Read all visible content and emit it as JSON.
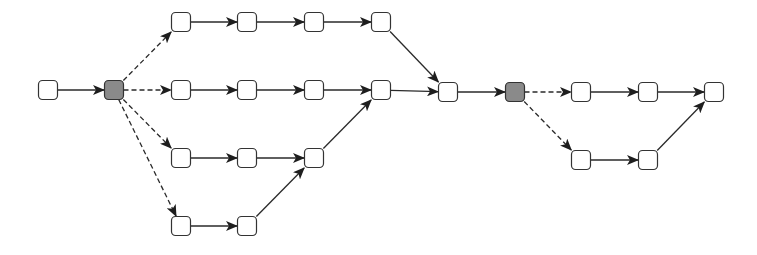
{
  "diagram": {
    "type": "process-flow-graph",
    "node_size": 19,
    "colors": {
      "node_fill": "#ffffff",
      "fork_fill": "#8a8a8a",
      "stroke": "#333333",
      "edge": "#2a2a2a"
    },
    "nodes": [
      {
        "id": "start",
        "x": 48,
        "y": 90,
        "kind": "normal"
      },
      {
        "id": "fork1",
        "x": 114,
        "y": 90,
        "kind": "fork"
      },
      {
        "id": "r1a",
        "x": 181,
        "y": 22,
        "kind": "normal"
      },
      {
        "id": "r1b",
        "x": 247,
        "y": 22,
        "kind": "normal"
      },
      {
        "id": "r1c",
        "x": 314,
        "y": 22,
        "kind": "normal"
      },
      {
        "id": "r1d",
        "x": 381,
        "y": 22,
        "kind": "normal"
      },
      {
        "id": "r2a",
        "x": 181,
        "y": 90,
        "kind": "normal"
      },
      {
        "id": "r2b",
        "x": 247,
        "y": 90,
        "kind": "normal"
      },
      {
        "id": "r2c",
        "x": 314,
        "y": 90,
        "kind": "normal"
      },
      {
        "id": "r2d",
        "x": 381,
        "y": 90,
        "kind": "normal"
      },
      {
        "id": "r3a",
        "x": 181,
        "y": 158,
        "kind": "normal"
      },
      {
        "id": "r3b",
        "x": 247,
        "y": 158,
        "kind": "normal"
      },
      {
        "id": "r3c",
        "x": 314,
        "y": 158,
        "kind": "normal"
      },
      {
        "id": "r4a",
        "x": 181,
        "y": 226,
        "kind": "normal"
      },
      {
        "id": "r4b",
        "x": 247,
        "y": 226,
        "kind": "normal"
      },
      {
        "id": "join",
        "x": 448,
        "y": 92,
        "kind": "normal"
      },
      {
        "id": "fork2",
        "x": 515,
        "y": 92,
        "kind": "fork"
      },
      {
        "id": "t1",
        "x": 581,
        "y": 92,
        "kind": "normal"
      },
      {
        "id": "t2",
        "x": 648,
        "y": 92,
        "kind": "normal"
      },
      {
        "id": "end",
        "x": 714,
        "y": 92,
        "kind": "normal"
      },
      {
        "id": "b1",
        "x": 581,
        "y": 160,
        "kind": "normal"
      },
      {
        "id": "b2",
        "x": 648,
        "y": 160,
        "kind": "normal"
      }
    ],
    "edges": [
      {
        "from": "start",
        "to": "fork1",
        "style": "solid"
      },
      {
        "from": "fork1",
        "to": "r1a",
        "style": "dashed"
      },
      {
        "from": "fork1",
        "to": "r2a",
        "style": "dashed"
      },
      {
        "from": "fork1",
        "to": "r3a",
        "style": "dashed"
      },
      {
        "from": "fork1",
        "to": "r4a",
        "style": "dashed"
      },
      {
        "from": "r1a",
        "to": "r1b",
        "style": "solid"
      },
      {
        "from": "r1b",
        "to": "r1c",
        "style": "solid"
      },
      {
        "from": "r1c",
        "to": "r1d",
        "style": "solid"
      },
      {
        "from": "r1d",
        "to": "join",
        "style": "solid"
      },
      {
        "from": "r2a",
        "to": "r2b",
        "style": "solid"
      },
      {
        "from": "r2b",
        "to": "r2c",
        "style": "solid"
      },
      {
        "from": "r2c",
        "to": "r2d",
        "style": "solid"
      },
      {
        "from": "r2d",
        "to": "join",
        "style": "solid"
      },
      {
        "from": "r3a",
        "to": "r3b",
        "style": "solid"
      },
      {
        "from": "r3b",
        "to": "r3c",
        "style": "solid"
      },
      {
        "from": "r3c",
        "to": "r2d",
        "style": "solid"
      },
      {
        "from": "r4a",
        "to": "r4b",
        "style": "solid"
      },
      {
        "from": "r4b",
        "to": "r3c",
        "style": "solid"
      },
      {
        "from": "join",
        "to": "fork2",
        "style": "solid"
      },
      {
        "from": "fork2",
        "to": "t1",
        "style": "dashed"
      },
      {
        "from": "fork2",
        "to": "b1",
        "style": "dashed"
      },
      {
        "from": "t1",
        "to": "t2",
        "style": "solid"
      },
      {
        "from": "t2",
        "to": "end",
        "style": "solid"
      },
      {
        "from": "b1",
        "to": "b2",
        "style": "solid"
      },
      {
        "from": "b2",
        "to": "end",
        "style": "solid"
      }
    ]
  }
}
